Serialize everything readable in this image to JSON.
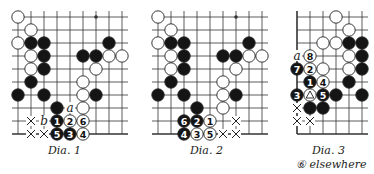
{
  "colors": {
    "line": "#333333",
    "black_stone": "#151515",
    "white_stone": "#ffffff",
    "stone_outline": "#222222"
  },
  "diagrams": [
    {
      "caption": "Dia.   1",
      "origin": [
        18,
        17
      ],
      "spacing": 13,
      "cols": 9,
      "rows": 10,
      "open_left": true,
      "open_right": true,
      "bottom_edge": true,
      "star_points": [
        [
          6,
          0
        ]
      ],
      "stones": [
        {
          "c": 0,
          "r": 0,
          "color": "white"
        },
        {
          "c": 1,
          "r": 1,
          "color": "white"
        },
        {
          "c": 0,
          "r": 2,
          "color": "white"
        },
        {
          "c": 1,
          "r": 2,
          "color": "black"
        },
        {
          "c": 2,
          "r": 2,
          "color": "black"
        },
        {
          "c": 7,
          "r": 2,
          "color": "black"
        },
        {
          "c": 1,
          "r": 3,
          "color": "white"
        },
        {
          "c": 2,
          "r": 3,
          "color": "black"
        },
        {
          "c": 5,
          "r": 3,
          "color": "black"
        },
        {
          "c": 6,
          "r": 3,
          "color": "black"
        },
        {
          "c": 7,
          "r": 3,
          "color": "white"
        },
        {
          "c": 8,
          "r": 3,
          "color": "white"
        },
        {
          "c": 1,
          "r": 4,
          "color": "white"
        },
        {
          "c": 2,
          "r": 4,
          "color": "black"
        },
        {
          "c": 6,
          "r": 4,
          "color": "white"
        },
        {
          "c": 1,
          "r": 5,
          "color": "black"
        },
        {
          "c": 5,
          "r": 5,
          "color": "white"
        },
        {
          "c": 0,
          "r": 6,
          "color": "black"
        },
        {
          "c": 2,
          "r": 6,
          "color": "black"
        },
        {
          "c": 5,
          "r": 6,
          "color": "white"
        },
        {
          "c": 6,
          "r": 6,
          "color": "black"
        },
        {
          "c": 3,
          "r": 7,
          "color": "black"
        },
        {
          "c": 5,
          "r": 7,
          "color": "white"
        },
        {
          "c": 3,
          "r": 8,
          "color": "black",
          "num": "1"
        },
        {
          "c": 4,
          "r": 8,
          "color": "white",
          "num": "2"
        },
        {
          "c": 5,
          "r": 8,
          "color": "white",
          "num": "6"
        },
        {
          "c": 3,
          "r": 9,
          "color": "black",
          "num": "5"
        },
        {
          "c": 4,
          "r": 9,
          "color": "black",
          "num": "3"
        },
        {
          "c": 5,
          "r": 9,
          "color": "white",
          "num": "4"
        }
      ],
      "marks": [
        {
          "c": 4,
          "r": 7,
          "type": "letter",
          "text": "a"
        },
        {
          "c": 2,
          "r": 8,
          "type": "letter",
          "text": "b"
        },
        {
          "c": 1,
          "r": 8,
          "type": "cross"
        },
        {
          "c": 1,
          "r": 9,
          "type": "cross"
        },
        {
          "c": 2,
          "r": 9,
          "type": "cross"
        }
      ]
    },
    {
      "caption": "Dia.   2",
      "origin": [
        158,
        17
      ],
      "spacing": 13,
      "cols": 9,
      "rows": 10,
      "open_left": true,
      "open_right": true,
      "bottom_edge": true,
      "star_points": [
        [
          6,
          0
        ]
      ],
      "stones": [
        {
          "c": 0,
          "r": 0,
          "color": "white"
        },
        {
          "c": 1,
          "r": 1,
          "color": "white"
        },
        {
          "c": 0,
          "r": 2,
          "color": "white"
        },
        {
          "c": 1,
          "r": 2,
          "color": "black"
        },
        {
          "c": 2,
          "r": 2,
          "color": "black"
        },
        {
          "c": 7,
          "r": 2,
          "color": "black"
        },
        {
          "c": 1,
          "r": 3,
          "color": "white"
        },
        {
          "c": 2,
          "r": 3,
          "color": "black"
        },
        {
          "c": 5,
          "r": 3,
          "color": "black"
        },
        {
          "c": 6,
          "r": 3,
          "color": "black"
        },
        {
          "c": 7,
          "r": 3,
          "color": "white"
        },
        {
          "c": 8,
          "r": 3,
          "color": "white"
        },
        {
          "c": 1,
          "r": 4,
          "color": "white"
        },
        {
          "c": 2,
          "r": 4,
          "color": "black"
        },
        {
          "c": 6,
          "r": 4,
          "color": "white"
        },
        {
          "c": 1,
          "r": 5,
          "color": "black"
        },
        {
          "c": 5,
          "r": 5,
          "color": "white"
        },
        {
          "c": 0,
          "r": 6,
          "color": "black"
        },
        {
          "c": 2,
          "r": 6,
          "color": "black"
        },
        {
          "c": 5,
          "r": 6,
          "color": "white"
        },
        {
          "c": 6,
          "r": 6,
          "color": "black"
        },
        {
          "c": 3,
          "r": 7,
          "color": "black"
        },
        {
          "c": 5,
          "r": 7,
          "color": "white"
        },
        {
          "c": 2,
          "r": 8,
          "color": "black",
          "num": "6"
        },
        {
          "c": 3,
          "r": 8,
          "color": "black",
          "num": "2"
        },
        {
          "c": 4,
          "r": 8,
          "color": "white",
          "num": "1"
        },
        {
          "c": 2,
          "r": 9,
          "color": "black",
          "num": "4"
        },
        {
          "c": 3,
          "r": 9,
          "color": "white",
          "num": "3"
        },
        {
          "c": 4,
          "r": 9,
          "color": "white",
          "num": "5"
        }
      ],
      "marks": [
        {
          "c": 6,
          "r": 8,
          "type": "cross"
        },
        {
          "c": 5,
          "r": 9,
          "type": "cross"
        },
        {
          "c": 6,
          "r": 9,
          "type": "cross"
        }
      ]
    },
    {
      "caption": "Dia.   3",
      "note": "⑥ elsewhere",
      "origin": [
        297,
        17
      ],
      "spacing": 13,
      "cols": 6,
      "rows": 10,
      "open_left": false,
      "open_right": true,
      "bottom_edge": true,
      "star_points": [],
      "stones": [
        {
          "c": 3,
          "r": 0,
          "color": "white"
        },
        {
          "c": 4,
          "r": 1,
          "color": "white"
        },
        {
          "c": 2,
          "r": 2,
          "color": "white"
        },
        {
          "c": 3,
          "r": 2,
          "color": "white"
        },
        {
          "c": 4,
          "r": 2,
          "color": "black"
        },
        {
          "c": 5,
          "r": 2,
          "color": "black"
        },
        {
          "c": 1,
          "r": 3,
          "color": "white",
          "num": "8"
        },
        {
          "c": 4,
          "r": 3,
          "color": "white"
        },
        {
          "c": 5,
          "r": 3,
          "color": "black"
        },
        {
          "c": 0,
          "r": 4,
          "color": "black",
          "num": "7"
        },
        {
          "c": 1,
          "r": 4,
          "color": "white",
          "num": "2"
        },
        {
          "c": 2,
          "r": 4,
          "color": "white"
        },
        {
          "c": 4,
          "r": 4,
          "color": "white"
        },
        {
          "c": 5,
          "r": 4,
          "color": "black"
        },
        {
          "c": 1,
          "r": 5,
          "color": "black",
          "num": "1"
        },
        {
          "c": 2,
          "r": 5,
          "color": "white",
          "num": "4"
        },
        {
          "c": 4,
          "r": 5,
          "color": "black"
        },
        {
          "c": 0,
          "r": 6,
          "color": "black",
          "num": "3"
        },
        {
          "c": 1,
          "r": 6,
          "color": "white",
          "triangle": true
        },
        {
          "c": 2,
          "r": 6,
          "color": "black",
          "num": "5"
        },
        {
          "c": 3,
          "r": 6,
          "color": "black"
        },
        {
          "c": 5,
          "r": 6,
          "color": "black"
        },
        {
          "c": 1,
          "r": 7,
          "color": "black"
        },
        {
          "c": 2,
          "r": 7,
          "color": "black"
        }
      ],
      "marks": [
        {
          "c": 0,
          "r": 3,
          "type": "letter",
          "text": "a"
        },
        {
          "c": 0,
          "r": 7,
          "type": "cross"
        },
        {
          "c": 0,
          "r": 8,
          "type": "cross"
        },
        {
          "c": 1,
          "r": 8,
          "type": "cross"
        }
      ]
    }
  ]
}
